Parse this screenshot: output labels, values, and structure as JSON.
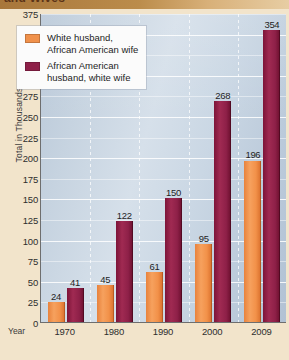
{
  "title": "and Wives",
  "axes": {
    "y_label": "Total in Thousands",
    "x_label": "Year"
  },
  "legend": {
    "series": [
      {
        "label": "White husband,\nAfrican American wife",
        "color": "#f0914b"
      },
      {
        "label": "African American\nhusband, white wife",
        "color": "#8e2048"
      }
    ]
  },
  "chart_data": {
    "type": "bar",
    "title": "and Wives",
    "xlabel": "Year",
    "ylabel": "Total in Thousands",
    "ylim": [
      0,
      375
    ],
    "yticks": [
      0,
      25,
      50,
      75,
      100,
      125,
      150,
      175,
      200,
      225,
      250,
      275,
      300,
      325,
      350,
      375
    ],
    "grid": true,
    "legend_position": "upper-left",
    "categories": [
      "1970",
      "1980",
      "1990",
      "2000",
      "2009"
    ],
    "series": [
      {
        "name": "White husband, African American wife",
        "color": "#f0914b",
        "values": [
          24,
          45,
          61,
          95,
          196
        ]
      },
      {
        "name": "African American husband, white wife",
        "color": "#8e2048",
        "values": [
          41,
          122,
          150,
          268,
          354
        ]
      }
    ]
  }
}
